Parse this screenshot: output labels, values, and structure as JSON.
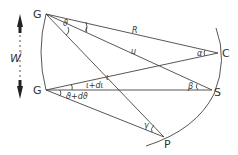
{
  "diagram": {
    "points": {
      "G_top": {
        "label": "G",
        "x": 46,
        "y": 14
      },
      "G_bottom": {
        "label": "G",
        "x": 46,
        "y": 90
      },
      "C": {
        "label": "C",
        "x": 218,
        "y": 53
      },
      "S": {
        "label": "S",
        "x": 212,
        "y": 90
      },
      "P": {
        "label": "P",
        "x": 164,
        "y": 137
      }
    },
    "line_labels": {
      "R": "R",
      "u": "u",
      "iota": "ι"
    },
    "angle_labels": {
      "theta": "ϑ",
      "iota": "ι",
      "alpha": "α",
      "beta": "β",
      "gamma": "γ",
      "iota_plus_diota": "ι+dι",
      "theta_plus_dtheta": "ϑ+dϑ"
    },
    "side_label": "W",
    "side_label_sub": "i"
  }
}
